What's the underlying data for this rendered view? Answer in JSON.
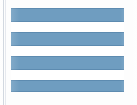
{
  "image": {
    "kind": "striped-swatch-thumbnail",
    "width": 137,
    "height": 105,
    "background_color": "#fdfdfd",
    "description": "Horizontally striped blue and white rectangle"
  },
  "left_margin_rule": {
    "name": "vertical-rule",
    "color": "#b9c2cf",
    "secondary_color": "#dfe3ea"
  },
  "swatch": {
    "name": "striped-flag",
    "left": 11,
    "top": 8,
    "width": 113,
    "height": 84,
    "blue_color": "#6f9dc0",
    "blue_edge_color": "#5d8bb0",
    "white_color": "#ffffff",
    "stripe_count": 7,
    "blue_stripe_count": 4,
    "white_stripe_count": 3,
    "stripes": [
      {
        "color_name": "blue",
        "height_px": 14
      },
      {
        "color_name": "white",
        "height_px": 10
      },
      {
        "color_name": "blue",
        "height_px": 14
      },
      {
        "color_name": "white",
        "height_px": 10
      },
      {
        "color_name": "blue",
        "height_px": 14
      },
      {
        "color_name": "white",
        "height_px": 10
      },
      {
        "color_name": "blue",
        "height_px": 12
      }
    ]
  }
}
